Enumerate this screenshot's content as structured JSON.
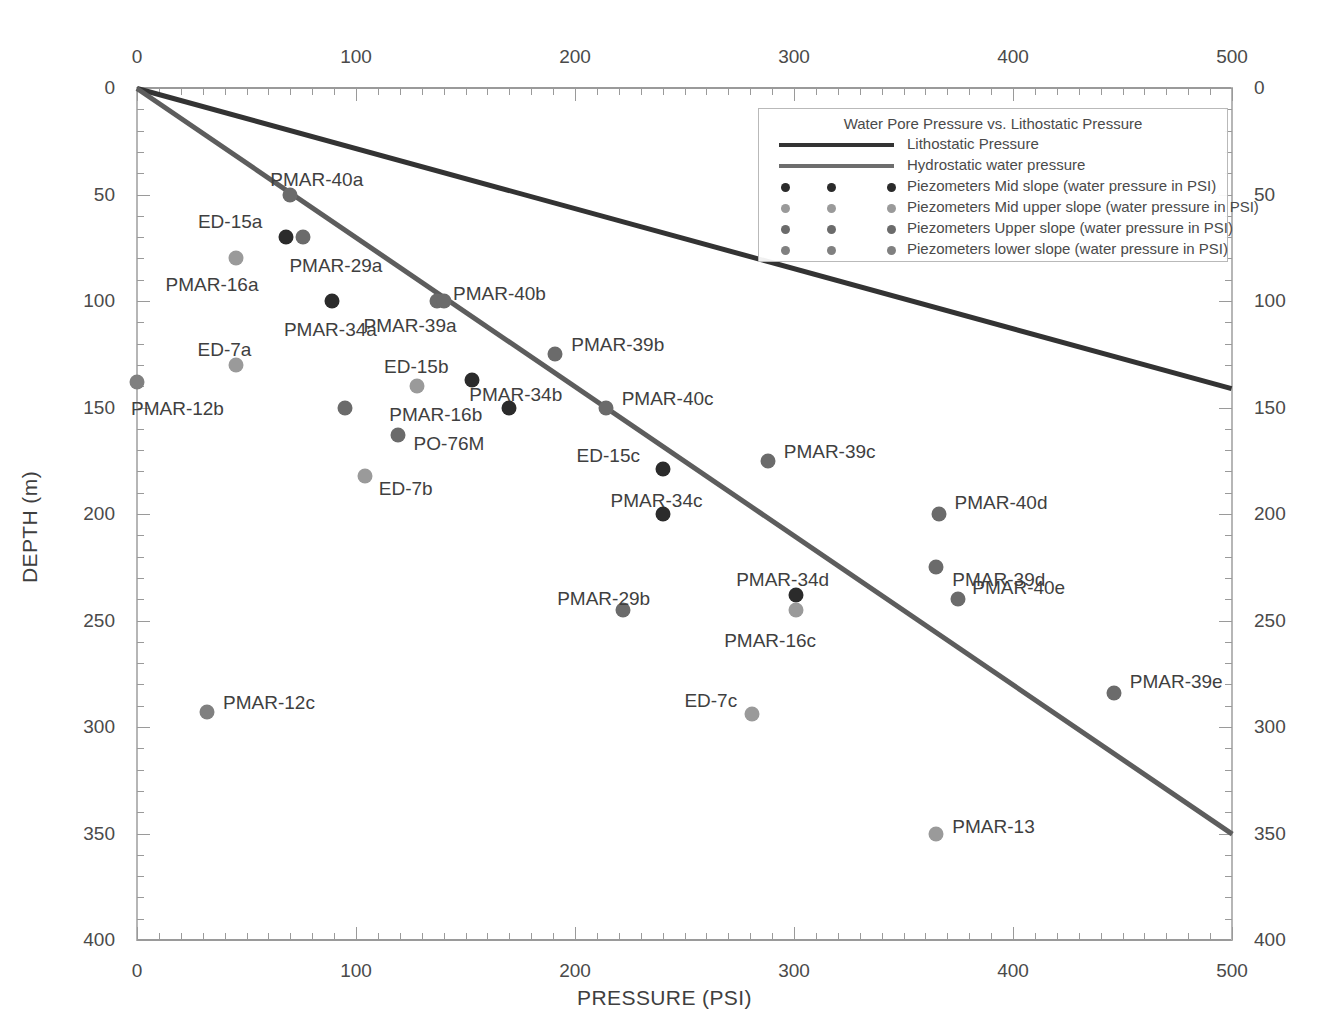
{
  "chart_data": {
    "type": "scatter",
    "title": "Water Pore Pressure vs. Lithostatic Pressure",
    "xlabel": "PRESSURE (PSI)",
    "ylabel": "DEPTH (m)",
    "xlim": [
      0,
      500
    ],
    "ylim": [
      0,
      400
    ],
    "y_inverted": true,
    "grid": false,
    "x_ticks": [
      0,
      100,
      200,
      300,
      400,
      500
    ],
    "x_tick_labels": [
      "0",
      "100",
      "200",
      "300",
      "400",
      "500"
    ],
    "x_minor_tick_step": 10,
    "y_ticks": [
      0,
      50,
      100,
      150,
      200,
      250,
      300,
      350,
      400
    ],
    "y_tick_labels": [
      "0",
      "50",
      "100",
      "150",
      "200",
      "250",
      "300",
      "350",
      "400"
    ],
    "y_minor_tick_step": 10,
    "x_axis_top": true,
    "x_axis_bottom": true,
    "y_axis_left": true,
    "y_axis_right": true,
    "legend_position": "top-right",
    "series": [
      {
        "name": "Lithostatic Pressure",
        "kind": "line",
        "color": "#333333",
        "width": 5,
        "points": [
          [
            0,
            0
          ],
          [
            500,
            141
          ]
        ]
      },
      {
        "name": "Hydrostatic water pressure",
        "kind": "line",
        "color": "#5d5d5d",
        "width": 5,
        "points": [
          [
            0,
            0
          ],
          [
            500,
            350
          ]
        ]
      },
      {
        "name": "Piezometers Mid slope (water pressure in PSI)",
        "kind": "scatter",
        "color": "#2b2b2b",
        "points": [
          {
            "label": "ED-15a",
            "x": 68,
            "y": 70,
            "label_dx": -88,
            "label_dy": -26
          },
          {
            "label": "PMAR-34a",
            "x": 89,
            "y": 100,
            "label_dx": -48,
            "label_dy": 18
          },
          {
            "label": "ED-15b",
            "x": 153,
            "y": 137,
            "label_dx": -88,
            "label_dy": -24
          },
          {
            "label": "PMAR-34b",
            "x": 170,
            "y": 150,
            "label_dx": -40,
            "label_dy": -24
          },
          {
            "label": "ED-15c",
            "x": 240,
            "y": 179,
            "label_dx": -86,
            "label_dy": -24
          },
          {
            "label": "PMAR-34c",
            "x": 240,
            "y": 200,
            "label_dx": -52,
            "label_dy": -24
          },
          {
            "label": "PMAR-34d",
            "x": 301,
            "y": 238,
            "label_dx": -60,
            "label_dy": -26
          }
        ]
      },
      {
        "name": "Piezometers Mid upper slope (water pressure in PSI)",
        "kind": "scatter",
        "color": "#9a9a9a",
        "points": [
          {
            "label": "PMAR-16a",
            "x": 45,
            "y": 80,
            "label_dx": -70,
            "label_dy": 16
          },
          {
            "label": "ED-7a",
            "x": 45,
            "y": 130,
            "label_dx": -38,
            "label_dy": -26
          },
          {
            "label": "PMAR-16b",
            "x": 128,
            "y": 140,
            "label_dx": -28,
            "label_dy": 18
          },
          {
            "label": "ED-7b",
            "x": 104,
            "y": 182,
            "label_dx": 14,
            "label_dy": 2
          },
          {
            "label": "PMAR-16c",
            "x": 301,
            "y": 245,
            "label_dx": -72,
            "label_dy": 20
          },
          {
            "label": "ED-7c",
            "x": 281,
            "y": 294,
            "label_dx": -68,
            "label_dy": -24
          },
          {
            "label": "PMAR-13",
            "x": 365,
            "y": 350,
            "label_dx": 16,
            "label_dy": -18
          }
        ]
      },
      {
        "name": "Piezometers Upper slope (water pressure in PSI)",
        "kind": "scatter",
        "color": "#6b6b6b",
        "points": [
          {
            "label": "PMAR-40a",
            "x": 70,
            "y": 50,
            "label_dx": -20,
            "label_dy": -26
          },
          {
            "label": "PMAR-29a",
            "x": 76,
            "y": 70,
            "label_dx": -14,
            "label_dy": 18
          },
          {
            "label": "PMAR-40b",
            "x": 137,
            "y": 100,
            "label_dx": 16,
            "label_dy": -18
          },
          {
            "label": "PMAR-39a",
            "x": 140,
            "y": 100,
            "label_dx": -80,
            "label_dy": 14
          },
          {
            "label": "PMAR-29a2",
            "x": 95,
            "y": 150,
            "label_dx": -40,
            "label_dy": 18
          },
          {
            "label": "PMAR-39b",
            "x": 191,
            "y": 125,
            "label_dx": 16,
            "label_dy": -20
          },
          {
            "label": "PO-76M",
            "x": 119,
            "y": 163,
            "label_dx": 16,
            "label_dy": -2
          },
          {
            "label": "PMAR-40c",
            "x": 214,
            "y": 150,
            "label_dx": 16,
            "label_dy": -20
          },
          {
            "label": "PMAR-39c",
            "x": 288,
            "y": 175,
            "label_dx": 16,
            "label_dy": -20
          },
          {
            "label": "PMAR-40d",
            "x": 366,
            "y": 200,
            "label_dx": 16,
            "label_dy": -22
          },
          {
            "label": "PMAR-39d",
            "x": 365,
            "y": 225,
            "label_dx": 16,
            "label_dy": 2
          },
          {
            "label": "PMAR-29b",
            "x": 222,
            "y": 245,
            "label_dx": -66,
            "label_dy": -22
          },
          {
            "label": "PMAR-40e",
            "x": 375,
            "y": 240,
            "label_dx": 14,
            "label_dy": -22
          },
          {
            "label": "PMAR-39e",
            "x": 446,
            "y": 284,
            "label_dx": 16,
            "label_dy": -22
          }
        ]
      },
      {
        "name": "Piezometers  lower slope (water pressure in PSI)",
        "kind": "scatter",
        "color": "#808080",
        "points": [
          {
            "label": "PMAR-12b",
            "x": 0,
            "y": 138,
            "label_dx": -6,
            "label_dy": 16
          },
          {
            "label": "PMAR-12c",
            "x": 32,
            "y": 293,
            "label_dx": 16,
            "label_dy": -20
          }
        ]
      }
    ]
  },
  "legend": {
    "title": "Water Pore Pressure vs. Lithostatic Pressure",
    "entries": [
      {
        "type": "line",
        "label": "Lithostatic Pressure",
        "color": "#333333"
      },
      {
        "type": "line",
        "label": "Hydrostatic water pressure",
        "color": "#6d6d6d"
      },
      {
        "type": "dots",
        "label": "Piezometers Mid slope (water pressure in PSI)",
        "color": "#2b2b2b"
      },
      {
        "type": "dots",
        "label": "Piezometers Mid upper slope (water pressure in PSI)",
        "color": "#9a9a9a"
      },
      {
        "type": "dots",
        "label": "Piezometers Upper slope (water pressure in PSI)",
        "color": "#6b6b6b"
      },
      {
        "type": "dots",
        "label": "Piezometers  lower slope (water pressure in PSI)",
        "color": "#808080"
      }
    ]
  },
  "axes": {
    "x_title": "PRESSURE (PSI)",
    "y_title": "DEPTH (m)"
  },
  "colors": {
    "lithostatic": "#333333",
    "hydrostatic": "#5d5d5d",
    "mid_slope": "#2b2b2b",
    "mid_upper_slope": "#9a9a9a",
    "upper_slope": "#6b6b6b",
    "lower_slope": "#808080",
    "axis": "#9a9a9a",
    "text": "#3f3f3f"
  }
}
